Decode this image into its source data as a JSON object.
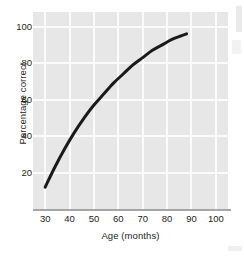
{
  "chart_data": {
    "type": "line",
    "title": "",
    "xlabel": "Age (months)",
    "ylabel": "Percentage correct",
    "xlim": [
      25,
      105
    ],
    "ylim": [
      0,
      108
    ],
    "xticks": [
      30,
      40,
      50,
      60,
      70,
      80,
      90,
      100
    ],
    "yticks": [
      20,
      40,
      60,
      80,
      100
    ],
    "xtick_labels": [
      "30",
      "40",
      "50",
      "60",
      "70",
      "80",
      "90",
      "100"
    ],
    "ytick_labels": [
      "20",
      "40",
      "60",
      "80",
      "100"
    ],
    "grid": true,
    "legend": null,
    "series": [
      {
        "name": "Percentage correct by age",
        "x": [
          30,
          34,
          38,
          42,
          46,
          50,
          54,
          58,
          62,
          66,
          70,
          74,
          78,
          82,
          86,
          88
        ],
        "values": [
          12,
          23,
          33,
          42,
          50,
          57,
          63,
          69,
          74,
          79,
          83,
          87,
          90,
          93,
          95,
          96
        ],
        "color": "#1a1a1a",
        "line_width": 3,
        "marker": "none"
      }
    ],
    "style": {
      "panel_background": "#e7e7e7",
      "gridline_color": "#fbfbfb",
      "axis_line_color": "#a6a6a6",
      "text_color": "#231f20",
      "figure_background": "#ffffff"
    }
  }
}
